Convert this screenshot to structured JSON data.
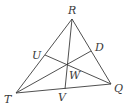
{
  "diagram": {
    "type": "triangle-with-cevians",
    "stroke_color": "#3c3c3c",
    "background": "#ffffff",
    "points": {
      "R": {
        "label": "R",
        "x": 72,
        "y": 19,
        "lx": 68,
        "ly": 14
      },
      "T": {
        "label": "T",
        "x": 16,
        "y": 93,
        "lx": 4,
        "ly": 103
      },
      "Q": {
        "label": "Q",
        "x": 111,
        "y": 84,
        "lx": 114,
        "ly": 92
      },
      "U": {
        "label": "U",
        "x": 45,
        "y": 55,
        "lx": 32,
        "ly": 59
      },
      "D": {
        "label": "D",
        "x": 91,
        "y": 51,
        "lx": 95,
        "ly": 51
      },
      "V": {
        "label": "V",
        "x": 65,
        "y": 89,
        "lx": 58,
        "ly": 101
      },
      "W": {
        "label": "W",
        "x": 67,
        "y": 66,
        "lx": 69,
        "ly": 79
      }
    },
    "segments": [
      {
        "from": "R",
        "to": "T"
      },
      {
        "from": "T",
        "to": "Q"
      },
      {
        "from": "Q",
        "to": "R"
      },
      {
        "from": "R",
        "to": "V"
      },
      {
        "from": "T",
        "to": "D"
      },
      {
        "from": "Q",
        "to": "U"
      }
    ]
  }
}
